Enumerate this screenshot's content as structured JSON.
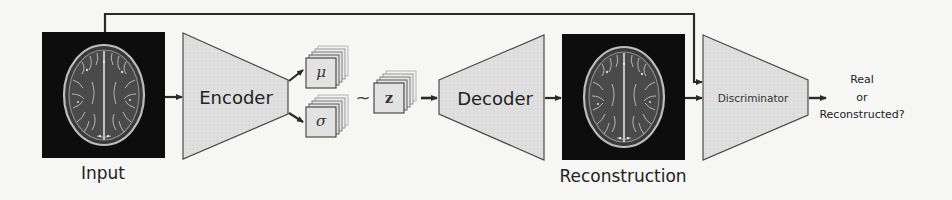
{
  "diagram": {
    "type": "VAE-GAN architecture",
    "nodes": {
      "input": {
        "label": "Input",
        "kind": "mri-image"
      },
      "encoder": {
        "label": "Encoder",
        "kind": "trapezoid-narrowing"
      },
      "mu": {
        "label": "μ",
        "kind": "feature-stack"
      },
      "sigma": {
        "label": "σ",
        "kind": "feature-stack"
      },
      "sample_op": {
        "label": "~"
      },
      "z": {
        "label": "z",
        "kind": "feature-stack"
      },
      "decoder": {
        "label": "Decoder",
        "kind": "trapezoid-widening"
      },
      "reconstruction": {
        "label": "Reconstruction",
        "kind": "mri-image"
      },
      "discriminator": {
        "label": "Discriminator",
        "kind": "trapezoid-narrowing"
      },
      "output": {
        "lines": [
          "Real",
          "or",
          "Reconstructed?"
        ]
      }
    },
    "edges": [
      {
        "from": "input",
        "to": "encoder"
      },
      {
        "from": "encoder",
        "to": "mu"
      },
      {
        "from": "encoder",
        "to": "sigma"
      },
      {
        "from": "mu",
        "to": "z",
        "via": "~"
      },
      {
        "from": "sigma",
        "to": "z",
        "via": "~"
      },
      {
        "from": "z",
        "to": "decoder"
      },
      {
        "from": "decoder",
        "to": "reconstruction"
      },
      {
        "from": "reconstruction",
        "to": "discriminator"
      },
      {
        "from": "input",
        "to": "discriminator",
        "route": "top-bypass"
      },
      {
        "from": "discriminator",
        "to": "output"
      }
    ],
    "colors": {
      "block_fill": "#dcdcdc",
      "block_stroke": "#4a4a4a",
      "stack_fill": "#e2e2e2",
      "line": "#2a2a2a",
      "image_bg": "#0d0d0d"
    }
  }
}
